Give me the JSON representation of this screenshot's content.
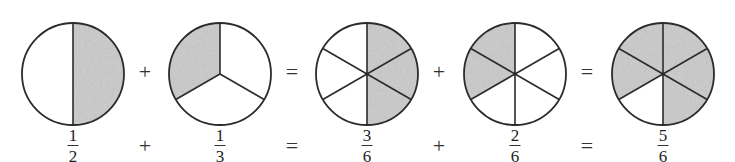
{
  "diagram": {
    "type": "fraction-addition-pie-diagram",
    "colors": {
      "stroke": "#2b2b2b",
      "shade": "#d3d3d3",
      "background": "#ffffff"
    },
    "circles": [
      {
        "id": "one-half",
        "cx": 73,
        "cy": 74,
        "r": 51,
        "parts": 2,
        "shaded_sectors": [
          [
            0,
            180
          ]
        ],
        "fraction": {
          "numerator": "1",
          "denominator": "2"
        }
      },
      {
        "id": "one-third",
        "cx": 220,
        "cy": 74,
        "r": 51,
        "parts": 3,
        "shaded_sectors": [
          [
            240,
            360
          ]
        ],
        "fraction": {
          "numerator": "1",
          "denominator": "3"
        }
      },
      {
        "id": "three-sixths",
        "cx": 367,
        "cy": 74,
        "r": 51,
        "parts": 6,
        "shaded_sectors": [
          [
            0,
            180
          ]
        ],
        "fraction": {
          "numerator": "3",
          "denominator": "6"
        }
      },
      {
        "id": "two-sixths",
        "cx": 515,
        "cy": 74,
        "r": 51,
        "parts": 6,
        "shaded_sectors": [
          [
            240,
            360
          ]
        ],
        "fraction": {
          "numerator": "2",
          "denominator": "6"
        }
      },
      {
        "id": "five-sixths",
        "cx": 663,
        "cy": 74,
        "r": 51,
        "parts": 6,
        "shaded_sectors": [
          [
            0,
            180
          ],
          [
            240,
            360
          ]
        ],
        "fraction": {
          "numerator": "5",
          "denominator": "6"
        }
      }
    ],
    "operators": [
      {
        "symbol": "+",
        "x": 145
      },
      {
        "symbol": "=",
        "x": 292
      },
      {
        "symbol": "+",
        "x": 439
      },
      {
        "symbol": "=",
        "x": 587
      }
    ],
    "operator_rows_y": {
      "top": 72,
      "bottom": 146
    },
    "fraction_row_y": 127,
    "equation_text": "1/2 + 1/3 = 3/6 + 2/6 = 5/6"
  }
}
